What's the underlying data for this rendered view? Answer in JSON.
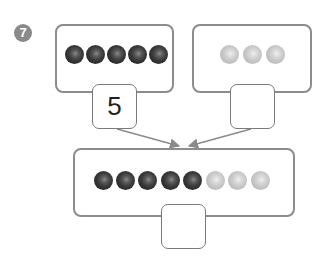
{
  "problem": {
    "number": "7"
  },
  "left_group": {
    "bead_color": "dark",
    "count": 5,
    "answer": "5"
  },
  "right_group": {
    "bead_color": "light",
    "count": 3,
    "answer": ""
  },
  "combined_group": {
    "dark_count": 5,
    "light_count": 3,
    "answer": ""
  },
  "colors": {
    "border": "#8c8c8c",
    "dark_bead": "#3c3c3c",
    "light_bead": "#c4c4c4",
    "badge": "#8a8a8a"
  }
}
